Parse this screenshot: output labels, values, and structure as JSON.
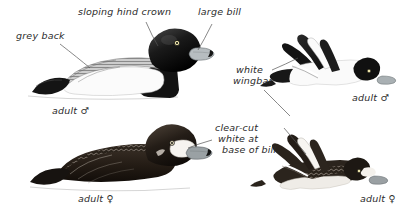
{
  "plate": {
    "title": "Greater Scaup identification plate",
    "background_color": "#ffffff",
    "ink_color": "#2b2b2b"
  },
  "annotations": [
    {
      "id": "grey-back",
      "text": "grey back",
      "x": 16,
      "y": 36
    },
    {
      "id": "sloping-hind-crown",
      "text": "sloping hind crown",
      "x": 78,
      "y": 12
    },
    {
      "id": "large-bill",
      "text": "large bill",
      "x": 198,
      "y": 12
    },
    {
      "id": "white-wingbar-line1",
      "text": "white",
      "x": 236,
      "y": 70
    },
    {
      "id": "white-wingbar-line2",
      "text": "wingbar",
      "x": 233,
      "y": 81
    },
    {
      "id": "clear-cut-line1",
      "text": "clear-cut",
      "x": 215,
      "y": 128
    },
    {
      "id": "clear-cut-line2",
      "text": "white at",
      "x": 218,
      "y": 139
    },
    {
      "id": "clear-cut-line3",
      "text": "base of bill",
      "x": 222,
      "y": 150
    }
  ],
  "figures": [
    {
      "id": "swimming-male",
      "caption": "adult ♂",
      "caption_x": 52,
      "caption_y": 108
    },
    {
      "id": "flying-male",
      "caption": "adult ♂",
      "caption_x": 352,
      "caption_y": 95
    },
    {
      "id": "swimming-female",
      "caption": "adult ♀",
      "caption_x": 78,
      "caption_y": 196
    },
    {
      "id": "flying-female",
      "caption": "adult ♀",
      "caption_x": 360,
      "caption_y": 196
    }
  ],
  "colors": {
    "black": "#111111",
    "dark_grey": "#3a3a3a",
    "mid_grey": "#8d8d8d",
    "light_grey": "#cfcfcf",
    "bill_grey": "#b9bfc2",
    "eye_yellow": "#f0e6a8",
    "water_line": "#dcdcdc"
  }
}
